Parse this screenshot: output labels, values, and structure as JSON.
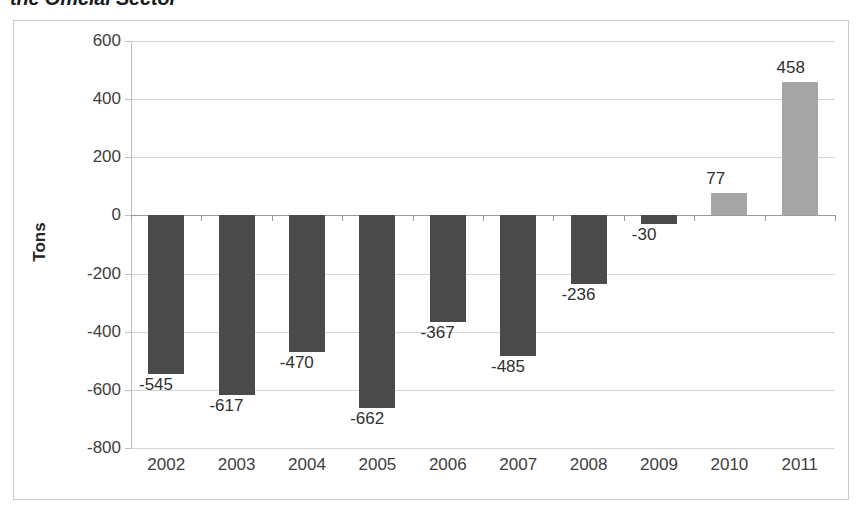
{
  "chart_data": {
    "type": "bar",
    "title": "the Official Sector",
    "subtitle": "",
    "xlabel": "",
    "ylabel": "Tons",
    "categories": [
      "2002",
      "2003",
      "2004",
      "2005",
      "2006",
      "2007",
      "2008",
      "2009",
      "2010",
      "2011"
    ],
    "values": [
      -545,
      -617,
      -470,
      -662,
      -367,
      -485,
      -236,
      -30,
      77,
      458
    ],
    "data_labels": [
      "-545",
      "-617",
      "-470",
      "-662",
      "-367",
      "-485",
      "-236",
      "-30",
      "77",
      "458"
    ],
    "ylim": [
      -800,
      600
    ],
    "ytick_values": [
      600,
      400,
      200,
      0,
      -200,
      -400,
      -600,
      -800
    ],
    "ytick_labels": [
      "600",
      "400",
      "200",
      "0",
      "-200",
      "-400",
      "-600",
      "-800"
    ],
    "grid": true,
    "legend": false,
    "legend_position": "none",
    "colors": {
      "negative_bar": "#4a4a4a",
      "positive_bar": "#a6a6a6",
      "gridline": "#d6d6d6",
      "zero_axis": "#9a9a9a",
      "frame_border": "#c9c9c9",
      "tick_label": "#404040",
      "data_label": "#303030",
      "title_text": "#1a1a1a",
      "plot_background": "#ffffff"
    }
  }
}
